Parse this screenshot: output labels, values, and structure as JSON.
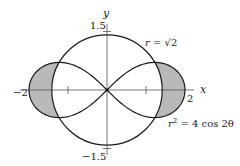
{
  "figure": {
    "type": "polar-region-diagram",
    "origin_px": [
      107,
      90
    ],
    "unit_px": 39,
    "shade_color": "#b9b9b9",
    "stroke_color": "#1a1a1a",
    "axis_color": "#555555"
  },
  "axes": {
    "x_label": "x",
    "y_label": "y",
    "x_ticks": [
      {
        "value": -2,
        "label": "−2"
      },
      {
        "value": -1,
        "label": ""
      },
      {
        "value": 1,
        "label": ""
      },
      {
        "value": 2,
        "label": "2"
      }
    ],
    "y_ticks": [
      {
        "value": 1.5,
        "label": "1.5"
      },
      {
        "value": -1.5,
        "label": "−1.5"
      }
    ]
  },
  "curves": [
    {
      "name": "circle",
      "equation": "r = √2",
      "radius": 1.41421
    },
    {
      "name": "lemniscate",
      "equation": "r² = 4 cos 2θ",
      "a_squared": 4
    }
  ],
  "labels": {
    "circle_eq_prefix": "r = ",
    "circle_eq_root": "√2",
    "lemniscate_r": "r",
    "lemniscate_exp": "2",
    "lemniscate_rest": " = 4 cos 2θ",
    "x_axis": "x",
    "y_axis": "y",
    "tick_x_neg2": "−2",
    "tick_x_pos2": "2",
    "tick_y_pos": "1.5",
    "tick_y_neg": "−1.5"
  },
  "shaded_regions": [
    "inside lemniscate, outside circle (left lobe)",
    "inside lemniscate, outside circle (right lobe)"
  ]
}
